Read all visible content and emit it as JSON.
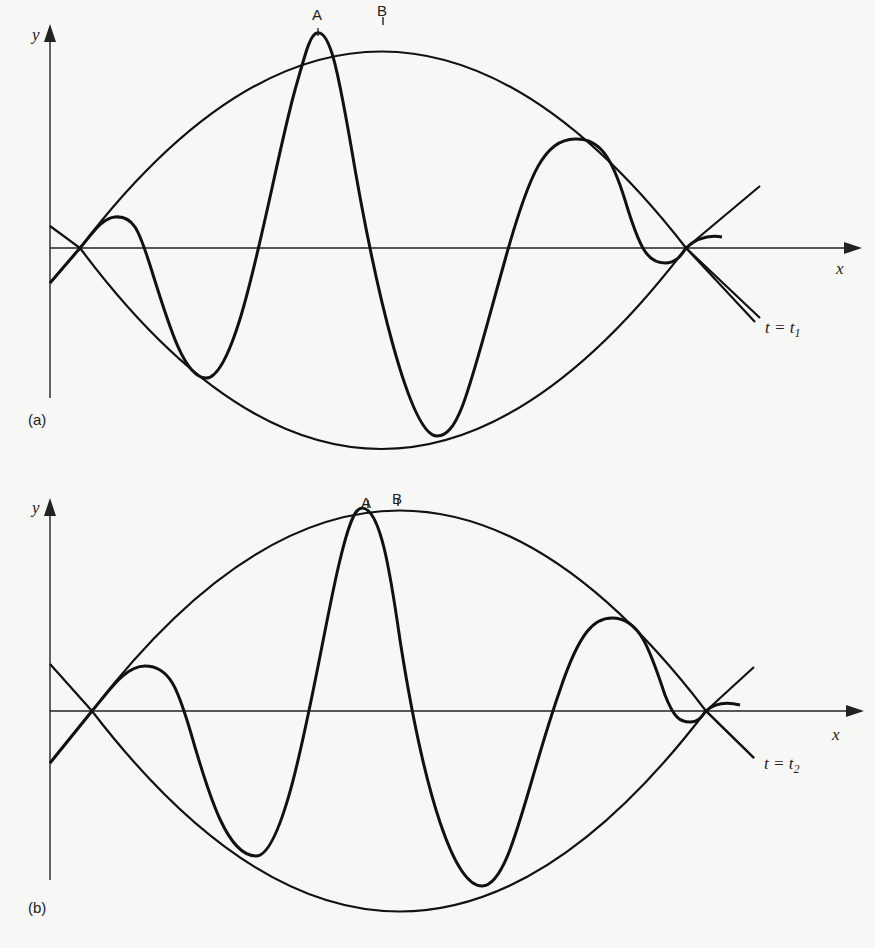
{
  "panels": [
    {
      "id": "a",
      "panel_label": "(a)",
      "y_axis_label": "y",
      "x_axis_label": "x",
      "time_label_pre": "t = t",
      "time_label_sub": "1",
      "point_a_label": "A",
      "point_b_label": "B"
    },
    {
      "id": "b",
      "panel_label": "(b)",
      "y_axis_label": "y",
      "x_axis_label": "x",
      "time_label_pre": "t = t",
      "time_label_sub": "2",
      "point_a_label": "A",
      "point_b_label": "B"
    }
  ]
}
